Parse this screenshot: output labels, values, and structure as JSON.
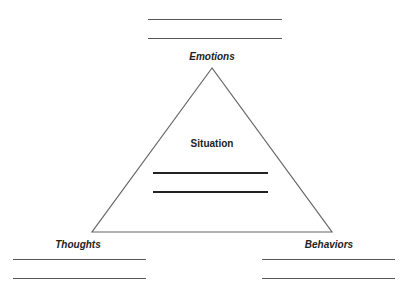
{
  "diagram": {
    "center": {
      "label": "Situation",
      "blank_lines": 2
    },
    "vertices": [
      {
        "id": "emotions",
        "label": "Emotions",
        "position": "top",
        "blank_lines": 2
      },
      {
        "id": "thoughts",
        "label": "Thoughts",
        "position": "bottom-left",
        "blank_lines": 2
      },
      {
        "id": "behaviors",
        "label": "Behaviors",
        "position": "bottom-right",
        "blank_lines": 2
      }
    ],
    "colors": {
      "line": "#555555",
      "text": "#222222",
      "background": "#ffffff"
    }
  }
}
